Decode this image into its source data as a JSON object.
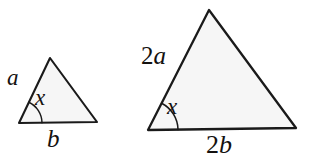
{
  "figure": {
    "background_color": "#ffffff",
    "stroke_color": "#1a1a1a",
    "fill_color": "#f6f6f6",
    "text_color": "#14110f",
    "shapes": [
      {
        "name": "small-triangle",
        "points": "50,58 97,122 19,123",
        "vertices": {
          "apex": [
            50,
            58
          ],
          "bottom_right": [
            97,
            122
          ],
          "bottom_left": [
            19,
            123
          ]
        },
        "stroke_width": 2.1
      },
      {
        "name": "large-triangle",
        "points": "209,10 296,128 148,130",
        "vertices": {
          "apex": [
            209,
            10
          ],
          "bottom_right": [
            296,
            128
          ],
          "bottom_left": [
            148,
            130
          ]
        },
        "stroke_width": 2.3
      }
    ],
    "angle_arcs": [
      {
        "name": "small-angle-arc",
        "at_vertex": [
          19,
          123
        ],
        "radius": 23,
        "stroke_width": 1.5
      },
      {
        "name": "large-angle-arc",
        "at_vertex": [
          148,
          130
        ],
        "radius": 30,
        "stroke_width": 1.6
      }
    ],
    "labels": {
      "small_side_a": "a",
      "small_angle_x": "x",
      "small_base_b": "b",
      "large_side_2a_number": "2",
      "large_side_2a_letter": "a",
      "large_angle_x": "x",
      "large_base_2b_number": "2",
      "large_base_2b_letter": "b"
    }
  }
}
